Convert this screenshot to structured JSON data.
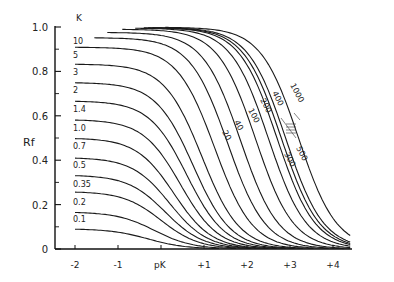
{
  "chart_data": {
    "type": "line",
    "title": "",
    "xlabel": "pK",
    "ylabel": "Rf",
    "xlim": [
      -2.5,
      5.0
    ],
    "ylim": [
      0,
      1.0
    ],
    "grid": false,
    "x_ticks": [
      "-2",
      "-1",
      "+1",
      "+2",
      "+3",
      "+4"
    ],
    "x_tick_values": [
      -2,
      -1,
      1,
      2,
      3,
      4
    ],
    "y_ticks": [
      "0",
      "0.2",
      "0.4",
      "0.6",
      "0.8",
      "1.0"
    ],
    "y_tick_values": [
      0,
      0.2,
      0.4,
      0.6,
      0.8,
      1.0
    ],
    "legend_title": "K",
    "series_left_labels": [
      "10",
      "5",
      "3",
      "2",
      "1.4",
      "1.0",
      "0.7",
      "0.5",
      "0.35",
      "0.2",
      "0.1"
    ],
    "series_right_labels": [
      "20",
      "40",
      "100",
      "200",
      "400",
      "1000",
      "500",
      "300"
    ],
    "series": [
      {
        "name": "0.1",
        "K": 0.1,
        "plateau": 0.091,
        "midpoint_pK": -0.3
      },
      {
        "name": "0.2",
        "K": 0.2,
        "plateau": 0.167,
        "midpoint_pK": -0.15
      },
      {
        "name": "0.35",
        "K": 0.35,
        "plateau": 0.259,
        "midpoint_pK": 0.0
      },
      {
        "name": "0.5",
        "K": 0.5,
        "plateau": 0.333,
        "midpoint_pK": 0.1
      },
      {
        "name": "0.7",
        "K": 0.7,
        "plateau": 0.412,
        "midpoint_pK": 0.2
      },
      {
        "name": "1.0",
        "K": 1.0,
        "plateau": 0.5,
        "midpoint_pK": 0.3
      },
      {
        "name": "1.4",
        "K": 1.4,
        "plateau": 0.583,
        "midpoint_pK": 0.45
      },
      {
        "name": "2",
        "K": 2,
        "plateau": 0.667,
        "midpoint_pK": 0.6
      },
      {
        "name": "3",
        "K": 3,
        "plateau": 0.75,
        "midpoint_pK": 0.75
      },
      {
        "name": "5",
        "K": 5,
        "plateau": 0.833,
        "midpoint_pK": 0.95
      },
      {
        "name": "10",
        "K": 10,
        "plateau": 0.909,
        "midpoint_pK": 1.25
      },
      {
        "name": "20",
        "K": 20,
        "plateau": 0.952,
        "midpoint_pK": 1.55
      },
      {
        "name": "40",
        "K": 40,
        "plateau": 0.976,
        "midpoint_pK": 1.85
      },
      {
        "name": "100",
        "K": 100,
        "plateau": 0.99,
        "midpoint_pK": 2.2
      },
      {
        "name": "200",
        "K": 200,
        "plateau": 0.995,
        "midpoint_pK": 2.5
      },
      {
        "name": "300",
        "K": 300,
        "plateau": 0.997,
        "midpoint_pK": 2.7
      },
      {
        "name": "400",
        "K": 400,
        "plateau": 0.9975,
        "midpoint_pK": 2.8
      },
      {
        "name": "500",
        "K": 500,
        "plateau": 0.998,
        "midpoint_pK": 2.9
      },
      {
        "name": "1000",
        "K": 1000,
        "plateau": 0.999,
        "midpoint_pK": 3.2
      }
    ]
  }
}
